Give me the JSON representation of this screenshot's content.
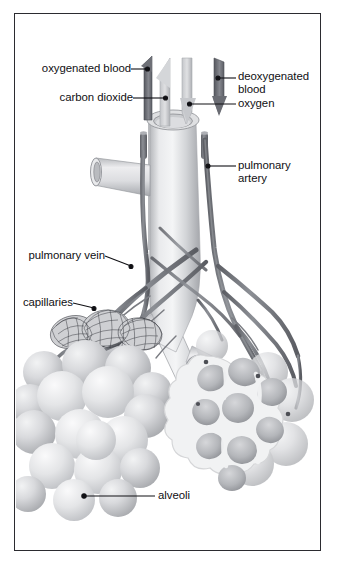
{
  "figure": {
    "background_color": "#ffffff",
    "frame_color": "#2b2b30",
    "text_color": "#101014"
  },
  "labels": {
    "oxygenated_blood": "oxygenated blood",
    "carbon_dioxide": "carbon dioxide",
    "deoxygenated_blood_line1": "deoxygenated",
    "deoxygenated_blood_line2": "blood",
    "oxygen": "oxygen",
    "pulmonary_artery_line1": "pulmonary",
    "pulmonary_artery_line2": "artery",
    "pulmonary_vein": "pulmonary vein",
    "capillaries": "capillaries",
    "alveoli": "alveoli"
  },
  "colors": {
    "vessel_dark": "#6f7176",
    "vessel_mid": "#8d9096",
    "airway_light": "#e3e4e6",
    "airway_shadow": "#a9abb0",
    "alveoli_light": "#e6e7e9",
    "alveoli_mid": "#c6c8cb",
    "alveoli_shadow": "#9fa1a6",
    "arrow_dark": "#70727a",
    "arrow_light": "#c9cbce",
    "leader_line": "#101014"
  },
  "arrows": [
    {
      "name": "oxygenated-blood-arrow",
      "direction": "up",
      "tone": "dark",
      "label": "oxygenated blood"
    },
    {
      "name": "carbon-dioxide-arrow",
      "direction": "up",
      "tone": "light",
      "label": "carbon dioxide"
    },
    {
      "name": "oxygen-arrow",
      "direction": "down",
      "tone": "light",
      "label": "oxygen"
    },
    {
      "name": "deoxygenated-blood-arrow",
      "direction": "down",
      "tone": "dark",
      "label": "deoxygenated blood"
    }
  ],
  "structures": [
    {
      "name": "trachea",
      "description": "central vertical airway tube with open top"
    },
    {
      "name": "bronchus-left-branch",
      "description": "horizontal cut branch to the left"
    },
    {
      "name": "bronchus-right-branch",
      "description": "descending branch to the right"
    },
    {
      "name": "pulmonary-artery",
      "description": "dark vessel descending on the right"
    },
    {
      "name": "pulmonary-vein",
      "description": "vessel crossing to the left cluster"
    },
    {
      "name": "capillary-network",
      "description": "mesh covering the left alveolar cluster"
    },
    {
      "name": "alveolar-cluster-left",
      "description": "grape-like bunch of alveoli"
    },
    {
      "name": "alveolar-cluster-right",
      "description": "cutaway cross-section of alveolar sac"
    }
  ]
}
